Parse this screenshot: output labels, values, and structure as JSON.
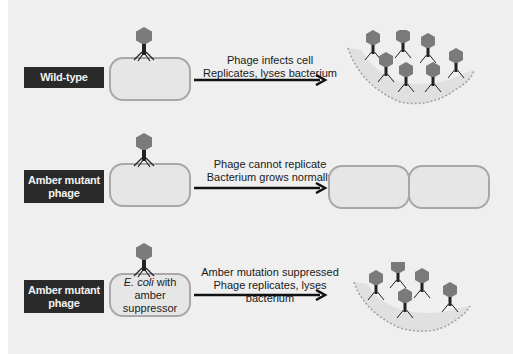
{
  "rows": [
    {
      "label": "Wild-type",
      "cell_text_italic": "",
      "cell_text": "",
      "caption_line1": "Phage infects cell",
      "caption_line2": "Replicates, lyses bacterium",
      "outcome": "lysis"
    },
    {
      "label": "Amber mutant phage",
      "cell_text_italic": "",
      "cell_text": "",
      "caption_line1": "Phage cannot replicate",
      "caption_line2": "Bacterium grows normally",
      "outcome": "division"
    },
    {
      "label": "Amber mutant phage",
      "cell_text_italic": "E. coli",
      "cell_text": " with amber suppressor",
      "caption_line1": "Amber mutation suppressed",
      "caption_line2": "Phage replicates, lyses bacterium",
      "outcome": "lysis"
    }
  ],
  "colors": {
    "label_bg": "#2a2a2a",
    "phage_head": "#7a7a7a",
    "phage_tail": "#222222",
    "cell_fill": "#e6e6e6",
    "cell_border": "#a8a8a8",
    "background": "#efefef"
  }
}
